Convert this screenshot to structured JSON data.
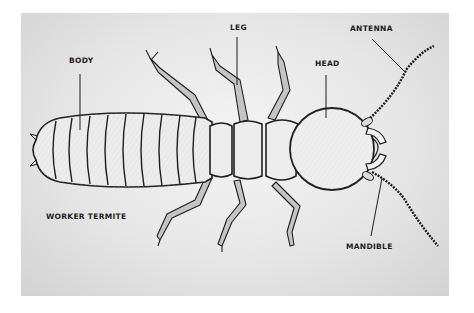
{
  "figure": {
    "title": "WORKER TERMITE",
    "labels": {
      "body": "BODY",
      "leg": "LEG",
      "head": "HEAD",
      "antenna": "ANTENNA",
      "mandible": "MANDIBLE"
    }
  },
  "colors": {
    "background": "#ffffff",
    "panel": "#e2e2e2",
    "ink": "#1e1e1e",
    "body_fill": "#ececec",
    "leg_fill": "#bdbdbd"
  }
}
